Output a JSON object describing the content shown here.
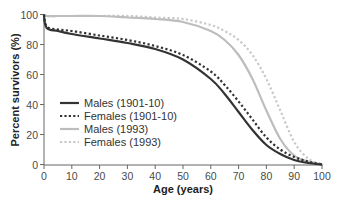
{
  "chart_data": {
    "type": "line",
    "title": "",
    "xlabel": "Age (years)",
    "ylabel": "Percent survivors (%)",
    "xlim": [
      0,
      100
    ],
    "ylim": [
      0,
      100
    ],
    "xticks": [
      0,
      10,
      20,
      30,
      40,
      50,
      60,
      70,
      80,
      90,
      100
    ],
    "yticks": [
      0,
      20,
      40,
      60,
      80,
      100
    ],
    "grid": false,
    "legend_position": "lower left",
    "x": [
      0,
      1,
      5,
      10,
      20,
      30,
      40,
      50,
      60,
      65,
      70,
      75,
      80,
      85,
      90,
      95,
      100
    ],
    "series": [
      {
        "name": "Males (1901-10)",
        "style": "solid",
        "color": "#333333",
        "values": [
          100,
          91,
          89,
          87,
          84,
          81,
          77,
          70,
          57,
          47,
          35,
          23,
          13,
          7,
          3,
          1,
          0
        ]
      },
      {
        "name": "Females (1901-10)",
        "style": "dotted",
        "color": "#333333",
        "values": [
          100,
          92,
          90,
          89,
          86,
          83,
          79,
          73,
          62,
          53,
          42,
          30,
          18,
          10,
          5,
          2,
          0
        ]
      },
      {
        "name": "Males (1993)",
        "style": "solid",
        "color": "#bdbdbd",
        "values": [
          100,
          99,
          99,
          99,
          99,
          98,
          97,
          95,
          89,
          83,
          73,
          57,
          36,
          17,
          6,
          2,
          0
        ]
      },
      {
        "name": "Females (1993)",
        "style": "dotted",
        "color": "#c8c8c8",
        "values": [
          100,
          99,
          99,
          99,
          99,
          99,
          98,
          97,
          93,
          89,
          83,
          73,
          57,
          36,
          15,
          4,
          0
        ]
      }
    ]
  },
  "axis": {
    "x_title": "Age (years)",
    "y_title": "Percent survivors (%)",
    "x_ticks": [
      "0",
      "10",
      "20",
      "30",
      "40",
      "50",
      "60",
      "70",
      "80",
      "90",
      "100"
    ],
    "y_ticks": [
      "0",
      "20",
      "40",
      "60",
      "80",
      "100"
    ]
  },
  "legend": {
    "items": [
      {
        "label": "Males (1901-10)"
      },
      {
        "label": "Females (1901-10)"
      },
      {
        "label": "Males (1993)"
      },
      {
        "label": "Females (1993)"
      }
    ]
  }
}
